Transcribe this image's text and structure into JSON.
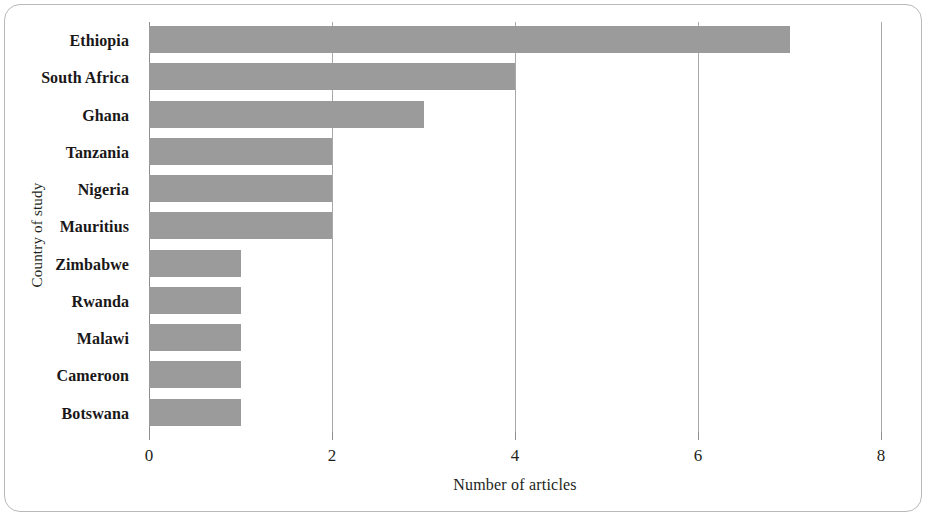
{
  "chart_data": {
    "type": "bar",
    "orientation": "horizontal",
    "title": "",
    "xlabel": "Number of articles",
    "ylabel": "Country of study",
    "categories": [
      "Ethiopia",
      "South Africa",
      "Ghana",
      "Tanzania",
      "Nigeria",
      "Mauritius",
      "Zimbabwe",
      "Rwanda",
      "Malawi",
      "Cameroon",
      "Botswana"
    ],
    "values": [
      7,
      4,
      3,
      2,
      2,
      2,
      1,
      1,
      1,
      1,
      1
    ],
    "xlim": [
      0,
      8
    ],
    "xticks": [
      0,
      2,
      4,
      6,
      8
    ],
    "xtick_labels": [
      "0",
      "2",
      "4",
      "6",
      "8"
    ],
    "grid": true,
    "grid_axis": "x",
    "legend": false,
    "bar_color": "#9b9b9b",
    "axis_color": "#8e8e92",
    "text_color": "#231f20"
  }
}
